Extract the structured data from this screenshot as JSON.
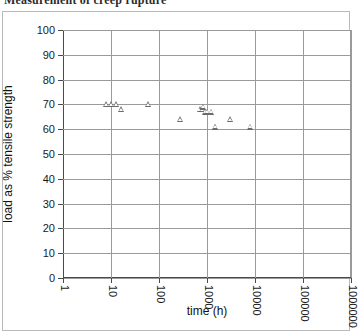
{
  "title": {
    "text": "Measurement of creep rupture",
    "truncated": true
  },
  "chart_data": {
    "type": "scatter",
    "title": "Measurement of creep rupture",
    "xlabel": "time (h)",
    "ylabel": "load as % tensile strength",
    "xscale": "log",
    "yscale": "linear",
    "xlim": [
      1,
      1000000
    ],
    "ylim": [
      0,
      100
    ],
    "grid": true,
    "legend": "none",
    "marker": "open-triangle",
    "marker_color": "#6b6b6b",
    "x_ticks": [
      1,
      10,
      100,
      1000,
      10000,
      100000,
      1000000
    ],
    "x_tick_labels": [
      "1",
      "10",
      "100",
      "1000",
      "10000",
      "100000",
      "1000000"
    ],
    "y_ticks": [
      0,
      10,
      20,
      30,
      40,
      50,
      60,
      70,
      80,
      90,
      100
    ],
    "y_tick_labels": [
      "0",
      "10",
      "20",
      "30",
      "40",
      "50",
      "60",
      "70",
      "80",
      "90",
      "100"
    ],
    "series": [
      {
        "name": "creep rupture data",
        "points": [
          {
            "x": 8,
            "y": 70
          },
          {
            "x": 10,
            "y": 70
          },
          {
            "x": 13,
            "y": 70
          },
          {
            "x": 16,
            "y": 68
          },
          {
            "x": 60,
            "y": 70
          },
          {
            "x": 280,
            "y": 64
          },
          {
            "x": 700,
            "y": 68
          },
          {
            "x": 780,
            "y": 68
          },
          {
            "x": 820,
            "y": 69
          },
          {
            "x": 900,
            "y": 67
          },
          {
            "x": 1000,
            "y": 67
          },
          {
            "x": 1200,
            "y": 67
          },
          {
            "x": 1450,
            "y": 61
          },
          {
            "x": 1500,
            "y": 61
          },
          {
            "x": 3000,
            "y": 64
          },
          {
            "x": 8000,
            "y": 61
          }
        ]
      }
    ]
  }
}
